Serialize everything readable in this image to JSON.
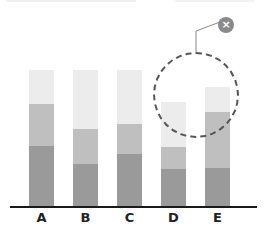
{
  "chart_data": {
    "type": "bar",
    "stacked": true,
    "title": "",
    "xlabel": "",
    "ylabel": "",
    "categories": [
      "A",
      "B",
      "C",
      "D",
      "E"
    ],
    "series": [
      {
        "name": "bottom",
        "color": "#9a9a9a",
        "values": [
          61,
          43,
          53,
          38,
          39
        ]
      },
      {
        "name": "middle",
        "color": "#bfbfbf",
        "values": [
          42,
          35,
          30,
          22,
          56
        ]
      },
      {
        "name": "top",
        "color": "#ececec",
        "values": [
          34,
          59,
          54,
          45,
          25
        ]
      }
    ],
    "ylim": [
      0,
      137
    ],
    "grid": false,
    "legend": "none",
    "annotations": [
      {
        "type": "dashed-circle-highlight",
        "target": [
          "D",
          "E"
        ],
        "note": "highlighted region around tops of bars D and E"
      },
      {
        "type": "close-button",
        "glyph": "×"
      }
    ]
  },
  "axis": {
    "labels": [
      "A",
      "B",
      "C",
      "D",
      "E"
    ]
  },
  "annotation": {
    "close_glyph": "×"
  },
  "colors": {
    "bottom": "#9a9a9a",
    "middle": "#bfbfbf",
    "top": "#ececec",
    "axis": "#1a1a1a",
    "highlight": "#555555",
    "close_button": "#8a8a8a"
  }
}
